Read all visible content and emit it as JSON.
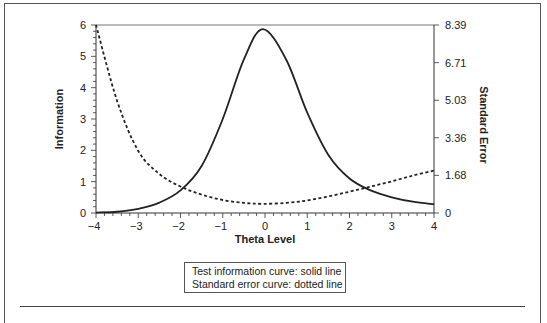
{
  "chart_data": {
    "type": "line",
    "title": "",
    "xlabel": "Theta Level",
    "ylabel": "Information",
    "y2label": "Standard Error",
    "xlim": [
      -4,
      4
    ],
    "ylim": [
      0,
      6
    ],
    "y2lim": [
      0,
      8.39
    ],
    "x_ticks": [
      "-4",
      "-3",
      "-2",
      "-1",
      "0",
      "1",
      "2",
      "3",
      "4"
    ],
    "y_ticks": [
      "0",
      "1",
      "2",
      "3",
      "4",
      "5",
      "6"
    ],
    "y2_ticks": [
      "0",
      "1.68",
      "3.36",
      "5.03",
      "6.71",
      "8.39"
    ],
    "grid": false,
    "legend_position": "below",
    "x": [
      -4,
      -3.5,
      -3,
      -2.5,
      -2,
      -1.5,
      -1,
      -0.5,
      -0.05,
      0.5,
      1,
      1.5,
      2,
      2.5,
      3,
      3.5,
      4
    ],
    "series": [
      {
        "name": "Test information curve",
        "style": "solid",
        "axis": "left",
        "values": [
          0.014,
          0.04,
          0.13,
          0.33,
          0.72,
          1.5,
          3.0,
          4.9,
          5.87,
          4.9,
          3.2,
          1.85,
          1.1,
          0.72,
          0.5,
          0.36,
          0.28
        ]
      },
      {
        "name": "Standard error curve",
        "style": "dotted",
        "axis": "right",
        "values": [
          8.39,
          5.0,
          2.77,
          1.74,
          1.18,
          0.82,
          0.58,
          0.45,
          0.41,
          0.45,
          0.56,
          0.74,
          0.95,
          1.18,
          1.41,
          1.67,
          1.89
        ]
      }
    ]
  },
  "labels": {
    "xlabel": "Theta Level",
    "ylabel": "Information",
    "y2label": "Standard Error",
    "legend_line1": "Test information curve: solid line",
    "legend_line2": "Standard error curve: dotted line"
  }
}
